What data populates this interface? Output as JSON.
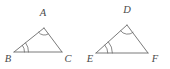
{
  "figure": {
    "name": "similar-triangles-pair",
    "background_color": "#ffffff",
    "stroke_color": "#6b6b6b",
    "label_color": "#4a4a4a",
    "triangles": [
      {
        "id": "triangle-abc",
        "name": "triangle-ABC",
        "vertices": [
          {
            "label": "A",
            "x": 44,
            "y": 28,
            "label_x": 43,
            "label_y": 16,
            "arc_count": 1
          },
          {
            "label": "B",
            "x": 14,
            "y": 52,
            "label_x": 8,
            "label_y": 62,
            "arc_count": 2
          },
          {
            "label": "C",
            "x": 62,
            "y": 52,
            "label_x": 68,
            "label_y": 62,
            "arc_count": 0
          }
        ],
        "sides": [
          {
            "from": "A",
            "to": "B"
          },
          {
            "from": "B",
            "to": "C"
          },
          {
            "from": "C",
            "to": "A"
          }
        ]
      },
      {
        "id": "triangle-def",
        "name": "triangle-DEF",
        "vertices": [
          {
            "label": "D",
            "x": 127,
            "y": 25,
            "label_x": 127,
            "label_y": 13,
            "arc_count": 1
          },
          {
            "label": "E",
            "x": 96,
            "y": 53,
            "label_x": 90,
            "label_y": 62,
            "arc_count": 2
          },
          {
            "label": "F",
            "x": 148,
            "y": 53,
            "label_x": 155,
            "label_y": 62,
            "arc_count": 0
          }
        ],
        "sides": [
          {
            "from": "D",
            "to": "E"
          },
          {
            "from": "E",
            "to": "F"
          },
          {
            "from": "F",
            "to": "D"
          }
        ]
      }
    ],
    "labels": {
      "a": "A",
      "b": "B",
      "c": "C",
      "d": "D",
      "e": "E",
      "f": "F"
    }
  }
}
